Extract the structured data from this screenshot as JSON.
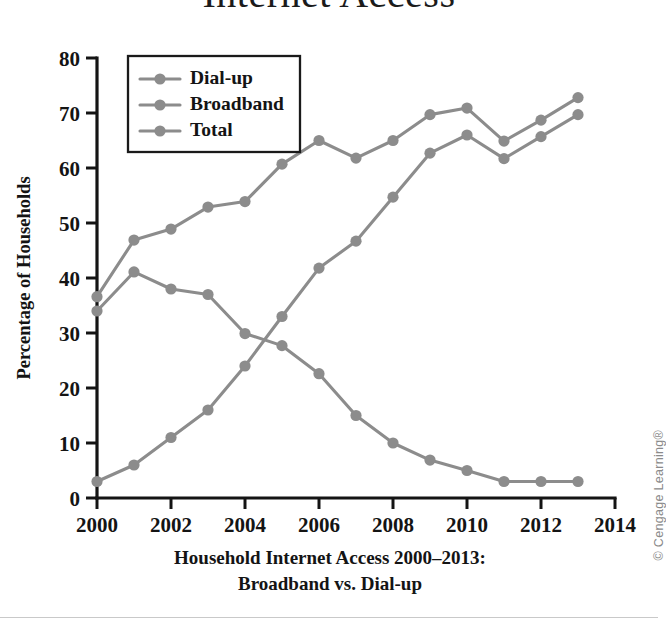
{
  "figure": {
    "title": "Internet Access",
    "caption_line1": "Household Internet Access 2000–2013:",
    "caption_line2": "Broadband vs. Dial-up",
    "credit": "© Cengage Learning®"
  },
  "chart_data": {
    "type": "line",
    "title": "Internet Access",
    "xlabel": "",
    "ylabel": "Percentage of Households",
    "x": [
      2000,
      2001,
      2002,
      2003,
      2004,
      2005,
      2006,
      2007,
      2008,
      2009,
      2010,
      2011,
      2012,
      2013
    ],
    "xlim": [
      2000,
      2014
    ],
    "ylim": [
      0,
      80
    ],
    "xticks": [
      2000,
      2002,
      2004,
      2006,
      2008,
      2010,
      2012,
      2014
    ],
    "yticks": [
      0,
      10,
      20,
      30,
      40,
      50,
      60,
      70,
      80
    ],
    "grid": false,
    "legend_position": "upper-left",
    "series": [
      {
        "name": "Dial-up",
        "color": "#8c8c8c",
        "values": [
          34.0,
          41.1,
          38.0,
          37.0,
          29.9,
          27.7,
          22.6,
          15.0,
          10.0,
          6.9,
          5.0,
          3.0,
          3.0,
          3.0
        ]
      },
      {
        "name": "Broadband",
        "color": "#8c8c8c",
        "values": [
          3.0,
          6.0,
          11.0,
          16.0,
          24.0,
          33.0,
          41.8,
          46.7,
          54.7,
          62.7,
          66.0,
          61.7,
          65.7,
          69.7
        ]
      },
      {
        "name": "Total",
        "color": "#8c8c8c",
        "values": [
          36.6,
          46.9,
          48.9,
          52.9,
          53.9,
          60.7,
          65.0,
          61.8,
          65.0,
          69.7,
          70.9,
          64.9,
          68.7,
          72.8
        ]
      }
    ]
  }
}
